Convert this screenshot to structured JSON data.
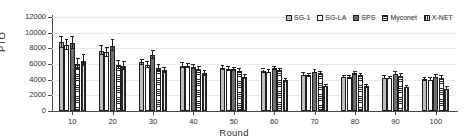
{
  "chart_data": {
    "type": "bar",
    "title": "",
    "xlabel": "Round",
    "ylabel": "PTO",
    "ylim": [
      0,
      12000
    ],
    "ytick_step": 2000,
    "yticks": [
      "0",
      "2000",
      "4000",
      "6000",
      "8000",
      "10000",
      "12000"
    ],
    "ytick_values": [
      0,
      2000,
      4000,
      6000,
      8000,
      10000,
      12000
    ],
    "categories": [
      "10",
      "20",
      "30",
      "40",
      "50",
      "60",
      "70",
      "80",
      "90",
      "100"
    ],
    "grid": "horizontal",
    "legend_position": "top-right",
    "error_bars": true,
    "series": [
      {
        "name": "SG-1",
        "fill": "light-gray-solid",
        "values": [
          8800,
          7700,
          6200,
          5800,
          5450,
          5100,
          4650,
          4350,
          4250,
          4050
        ],
        "errors": [
          700,
          600,
          350,
          300,
          250,
          200,
          200,
          180,
          180,
          170
        ]
      },
      {
        "name": "SG-LA",
        "fill": "white-solid",
        "values": [
          8400,
          7500,
          5900,
          5750,
          5350,
          5000,
          4550,
          4300,
          4200,
          4000
        ],
        "errors": [
          650,
          550,
          350,
          300,
          250,
          200,
          200,
          180,
          170,
          170
        ]
      },
      {
        "name": "SPS",
        "fill": "dark-gray-solid",
        "values": [
          8700,
          8350,
          7150,
          5600,
          5300,
          5450,
          5000,
          4800,
          4750,
          4400
        ],
        "errors": [
          800,
          750,
          500,
          300,
          250,
          200,
          200,
          180,
          180,
          170
        ]
      },
      {
        "name": "Myconet",
        "fill": "horizontal-stripes",
        "values": [
          6000,
          5850,
          5500,
          5350,
          5150,
          5200,
          4800,
          4600,
          4500,
          4250
        ],
        "errors": [
          650,
          550,
          350,
          300,
          250,
          200,
          200,
          180,
          170,
          160
        ]
      },
      {
        "name": "X-NET",
        "fill": "vertical-stripes",
        "values": [
          6400,
          5750,
          5200,
          4800,
          4400,
          3900,
          3200,
          3150,
          3050,
          2850
        ],
        "errors": [
          700,
          550,
          350,
          300,
          250,
          200,
          180,
          170,
          160,
          160
        ]
      }
    ]
  },
  "axes": {
    "y_title": "PTO",
    "x_title": "Round"
  }
}
